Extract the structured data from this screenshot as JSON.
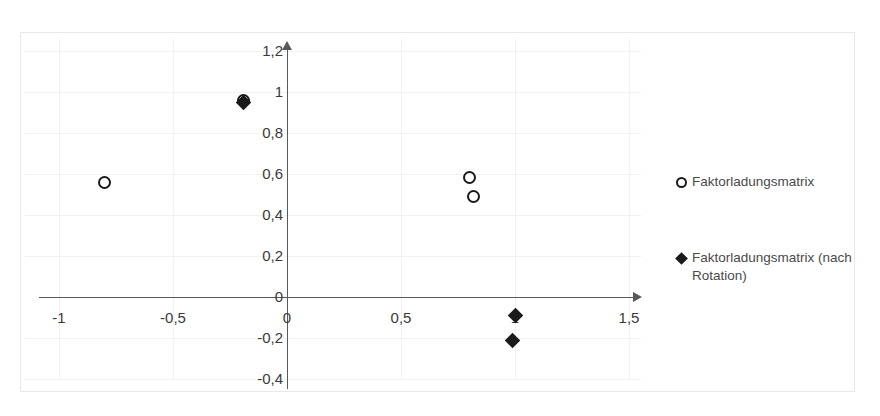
{
  "chart_data": {
    "type": "scatter",
    "title": "",
    "xlabel": "",
    "ylabel": "",
    "xlim": [
      -1.25,
      1.6
    ],
    "ylim": [
      -0.4,
      1.2
    ],
    "grid": true,
    "legend_position": "right",
    "x_ticks": [
      "-1",
      "-0,5",
      "0",
      "0,5",
      "1",
      "1,5"
    ],
    "x_tick_values": [
      -1,
      -0.5,
      0,
      0.5,
      1,
      1.5
    ],
    "y_ticks": [
      "1,2",
      "1",
      "0,8",
      "0,6",
      "0,4",
      "0,2",
      "0",
      "-0,2",
      "-0,4"
    ],
    "y_tick_values": [
      1.2,
      1.0,
      0.8,
      0.6,
      0.4,
      0.2,
      0,
      -0.2,
      -0.4
    ],
    "series": [
      {
        "name": "Faktorladungsmatrix",
        "marker": "open-circle",
        "color": "#1a1a1a",
        "points": [
          {
            "x": -0.8,
            "y": 0.56
          },
          {
            "x": -0.19,
            "y": 0.96
          },
          {
            "x": 0.8,
            "y": 0.585
          },
          {
            "x": 0.82,
            "y": 0.49
          }
        ]
      },
      {
        "name": "Faktorladungsmatrix (nach Rotation)",
        "marker": "filled-diamond",
        "color": "#1a1a1a",
        "points": [
          {
            "x": -0.19,
            "y": 0.95
          },
          {
            "x": 1.0,
            "y": -0.09
          },
          {
            "x": 0.99,
            "y": -0.21
          }
        ]
      }
    ]
  },
  "legend": {
    "entries": [
      {
        "label": "Faktorladungsmatrix",
        "marker": "open-circle"
      },
      {
        "label": "Faktorladungsmatrix (nach Rotation)",
        "marker": "filled-diamond"
      }
    ]
  }
}
